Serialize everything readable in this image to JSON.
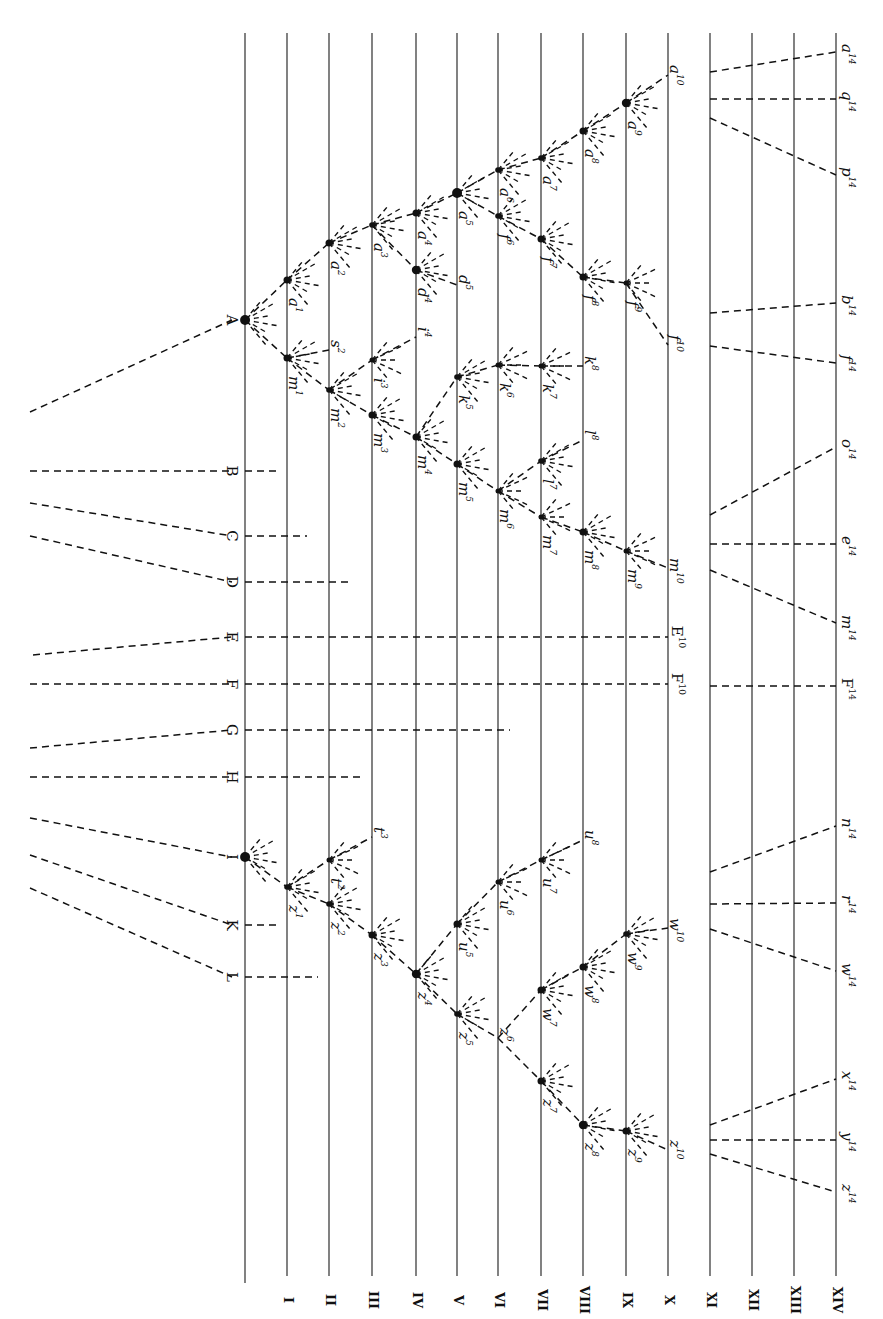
{
  "colors": {
    "ink": "#111111",
    "paper": "#ffffff"
  },
  "generations": [
    {
      "id": "base",
      "label": "",
      "x": 245
    },
    {
      "id": "I",
      "label": "I",
      "x": 287
    },
    {
      "id": "II",
      "label": "II",
      "x": 329
    },
    {
      "id": "III",
      "label": "III",
      "x": 372
    },
    {
      "id": "IV",
      "label": "IV",
      "x": 416
    },
    {
      "id": "V",
      "label": "V",
      "x": 457
    },
    {
      "id": "VI",
      "label": "VI",
      "x": 498
    },
    {
      "id": "VII",
      "label": "VII",
      "x": 541
    },
    {
      "id": "VIII",
      "label": "VIII",
      "x": 583
    },
    {
      "id": "IX",
      "label": "IX",
      "x": 626
    },
    {
      "id": "X",
      "label": "X",
      "x": 668
    },
    {
      "id": "XI",
      "label": "XI",
      "x": 710
    },
    {
      "id": "XII",
      "label": "XII",
      "x": 752
    },
    {
      "id": "XIII",
      "label": "XIII",
      "x": 794
    },
    {
      "id": "XIV",
      "label": "XIV",
      "x": 836
    }
  ],
  "ancestral_species": [
    {
      "label": "A",
      "y": 320,
      "tail": [
        30,
        412
      ]
    },
    {
      "label": "B",
      "y": 471,
      "tail": [
        30,
        471
      ],
      "stub_to": 277
    },
    {
      "label": "C",
      "y": 536,
      "tail": [
        30,
        503
      ],
      "stub_to": 307
    },
    {
      "label": "D",
      "y": 582,
      "tail": [
        30,
        536
      ],
      "stub_to": 353
    },
    {
      "label": "E",
      "y": 637,
      "tail": [
        33,
        655
      ],
      "stub_to": 668
    },
    {
      "label": "F",
      "y": 684,
      "tail": [
        30,
        684
      ],
      "stub_to": 668
    },
    {
      "label": "G",
      "y": 730,
      "tail": [
        30,
        748
      ],
      "stub_to": 510
    },
    {
      "label": "H",
      "y": 777,
      "tail": [
        30,
        777
      ],
      "stub_to": 360
    },
    {
      "label": "I",
      "y": 857,
      "tail": [
        30,
        818
      ]
    },
    {
      "label": "K",
      "y": 925,
      "tail": [
        30,
        855
      ],
      "stub_to": 280
    },
    {
      "label": "L",
      "y": 977,
      "tail": [
        30,
        888
      ],
      "stub_to": 318
    }
  ],
  "nodes": [
    {
      "id": "A",
      "x": 245,
      "y": 320,
      "size": 7
    },
    {
      "id": "a1",
      "name": "a",
      "gen": "1",
      "x": 287,
      "y": 280,
      "size": 5
    },
    {
      "id": "a2",
      "name": "a",
      "gen": "2",
      "x": 329,
      "y": 243,
      "size": 5
    },
    {
      "id": "a3",
      "name": "a",
      "gen": "3",
      "x": 372,
      "y": 225,
      "size": 4
    },
    {
      "id": "a4",
      "name": "a",
      "gen": "4",
      "x": 416,
      "y": 213,
      "size": 5
    },
    {
      "id": "a5",
      "name": "a",
      "gen": "5",
      "x": 457,
      "y": 193,
      "size": 7
    },
    {
      "id": "a6",
      "name": "a",
      "gen": "6",
      "x": 498,
      "y": 170,
      "size": 4
    },
    {
      "id": "a7",
      "name": "a",
      "gen": "7",
      "x": 541,
      "y": 158,
      "size": 4
    },
    {
      "id": "a8",
      "name": "a",
      "gen": "8",
      "x": 583,
      "y": 131,
      "size": 5
    },
    {
      "id": "a9",
      "name": "a",
      "gen": "9",
      "x": 626,
      "y": 103,
      "size": 6
    },
    {
      "id": "a10",
      "name": "a",
      "gen": "10",
      "x": 668,
      "y": 75,
      "size": 0
    },
    {
      "id": "d4",
      "name": "d",
      "gen": "4",
      "x": 416,
      "y": 270,
      "size": 6
    },
    {
      "id": "d5",
      "name": "d",
      "gen": "5",
      "x": 457,
      "y": 285,
      "size": 0
    },
    {
      "id": "f6",
      "name": "f",
      "gen": "6",
      "x": 498,
      "y": 216,
      "size": 4
    },
    {
      "id": "f7",
      "name": "f",
      "gen": "7",
      "x": 541,
      "y": 239,
      "size": 5
    },
    {
      "id": "f8",
      "name": "f",
      "gen": "8",
      "x": 583,
      "y": 277,
      "size": 5
    },
    {
      "id": "f9",
      "name": "f",
      "gen": "9",
      "x": 626,
      "y": 283,
      "size": 3
    },
    {
      "id": "f10",
      "name": "f",
      "gen": "10",
      "x": 668,
      "y": 345,
      "size": 0
    },
    {
      "id": "m1",
      "name": "m",
      "gen": "1",
      "x": 287,
      "y": 358,
      "size": 5
    },
    {
      "id": "s2",
      "name": "s",
      "gen": "2",
      "x": 329,
      "y": 350,
      "size": 0
    },
    {
      "id": "m2",
      "name": "m",
      "gen": "2",
      "x": 329,
      "y": 390,
      "size": 4
    },
    {
      "id": "i3",
      "name": "i",
      "gen": "3",
      "x": 372,
      "y": 360,
      "size": 3
    },
    {
      "id": "i4",
      "name": "i",
      "gen": "4",
      "x": 416,
      "y": 337,
      "size": 0
    },
    {
      "id": "m3",
      "name": "m",
      "gen": "3",
      "x": 372,
      "y": 415,
      "size": 5
    },
    {
      "id": "m4",
      "name": "m",
      "gen": "4",
      "x": 416,
      "y": 437,
      "size": 5
    },
    {
      "id": "k5",
      "name": "k",
      "gen": "5",
      "x": 457,
      "y": 377,
      "size": 4
    },
    {
      "id": "k6",
      "name": "k",
      "gen": "6",
      "x": 498,
      "y": 365,
      "size": 3
    },
    {
      "id": "k7",
      "name": "k",
      "gen": "7",
      "x": 541,
      "y": 366,
      "size": 3
    },
    {
      "id": "k8",
      "name": "k",
      "gen": "8",
      "x": 583,
      "y": 366,
      "size": 0
    },
    {
      "id": "m5",
      "name": "m",
      "gen": "5",
      "x": 457,
      "y": 464,
      "size": 5
    },
    {
      "id": "l7",
      "name": "l",
      "gen": "7",
      "x": 541,
      "y": 461,
      "size": 4
    },
    {
      "id": "l8",
      "name": "l",
      "gen": "8",
      "x": 583,
      "y": 440,
      "size": 0
    },
    {
      "id": "m6",
      "name": "m",
      "gen": "6",
      "x": 498,
      "y": 491,
      "size": 3
    },
    {
      "id": "m7",
      "name": "m",
      "gen": "7",
      "x": 541,
      "y": 517,
      "size": 3
    },
    {
      "id": "m8",
      "name": "m",
      "gen": "8",
      "x": 583,
      "y": 532,
      "size": 5
    },
    {
      "id": "m9",
      "name": "m",
      "gen": "9",
      "x": 626,
      "y": 551,
      "size": 3
    },
    {
      "id": "m10",
      "name": "m",
      "gen": "10",
      "x": 668,
      "y": 568,
      "size": 0
    },
    {
      "id": "I",
      "x": 245,
      "y": 857,
      "size": 7
    },
    {
      "id": "z1",
      "name": "z",
      "gen": "1",
      "x": 287,
      "y": 887,
      "size": 4
    },
    {
      "id": "t2",
      "name": "t",
      "gen": "2",
      "x": 329,
      "y": 860,
      "size": 3
    },
    {
      "id": "t3",
      "name": "t",
      "gen": "3",
      "x": 372,
      "y": 837,
      "size": 0
    },
    {
      "id": "z2",
      "name": "z",
      "gen": "2",
      "x": 329,
      "y": 904,
      "size": 4
    },
    {
      "id": "z3",
      "name": "z",
      "gen": "3",
      "x": 372,
      "y": 935,
      "size": 5
    },
    {
      "id": "z4",
      "name": "z",
      "gen": "4",
      "x": 416,
      "y": 974,
      "size": 6
    },
    {
      "id": "u5",
      "name": "u",
      "gen": "5",
      "x": 457,
      "y": 924,
      "size": 5
    },
    {
      "id": "u6",
      "name": "u",
      "gen": "6",
      "x": 498,
      "y": 882,
      "size": 3
    },
    {
      "id": "u7",
      "name": "u",
      "gen": "7",
      "x": 541,
      "y": 860,
      "size": 3
    },
    {
      "id": "u8",
      "name": "u",
      "gen": "8",
      "x": 583,
      "y": 840,
      "size": 0
    },
    {
      "id": "z5",
      "name": "z",
      "gen": "5",
      "x": 457,
      "y": 1014,
      "size": 4
    },
    {
      "id": "z6",
      "name": "z",
      "gen": "6",
      "x": 498,
      "y": 1038,
      "size": 0
    },
    {
      "id": "w7",
      "name": "w",
      "gen": "7",
      "x": 541,
      "y": 990,
      "size": 5
    },
    {
      "id": "w8",
      "name": "w",
      "gen": "8",
      "x": 583,
      "y": 967,
      "size": 5
    },
    {
      "id": "w9",
      "name": "w",
      "gen": "9",
      "x": 626,
      "y": 934,
      "size": 4
    },
    {
      "id": "w10",
      "name": "w",
      "gen": "10",
      "x": 668,
      "y": 928,
      "size": 0
    },
    {
      "id": "z7",
      "name": "z",
      "gen": "7",
      "x": 541,
      "y": 1081,
      "size": 5
    },
    {
      "id": "z8",
      "name": "z",
      "gen": "8",
      "x": 583,
      "y": 1125,
      "size": 6
    },
    {
      "id": "z9",
      "name": "z",
      "gen": "9",
      "x": 626,
      "y": 1131,
      "size": 5
    },
    {
      "id": "z10",
      "name": "z",
      "gen": "10",
      "x": 668,
      "y": 1150,
      "size": 0
    }
  ],
  "edges": [
    [
      "A",
      "a1"
    ],
    [
      "a1",
      "a2"
    ],
    [
      "a2",
      "a3"
    ],
    [
      "a3",
      "a4"
    ],
    [
      "a4",
      "a5"
    ],
    [
      "a5",
      "a6"
    ],
    [
      "a6",
      "a7"
    ],
    [
      "a7",
      "a8"
    ],
    [
      "a8",
      "a9"
    ],
    [
      "a9",
      "a10"
    ],
    [
      "a3",
      "d4"
    ],
    [
      "d4",
      "d5"
    ],
    [
      "a5",
      "f6"
    ],
    [
      "f6",
      "f7"
    ],
    [
      "f7",
      "f8"
    ],
    [
      "f8",
      "f9"
    ],
    [
      "f9",
      "f10"
    ],
    [
      "A",
      "m1"
    ],
    [
      "m1",
      "s2"
    ],
    [
      "m1",
      "m2"
    ],
    [
      "m2",
      "i3"
    ],
    [
      "i3",
      "i4"
    ],
    [
      "m2",
      "m3"
    ],
    [
      "m3",
      "m4"
    ],
    [
      "m4",
      "k5"
    ],
    [
      "k5",
      "k6"
    ],
    [
      "k6",
      "k7"
    ],
    [
      "k7",
      "k8"
    ],
    [
      "m4",
      "m5"
    ],
    [
      "m5",
      "m6"
    ],
    [
      "m6",
      "l7"
    ],
    [
      "l7",
      "l8"
    ],
    [
      "m6",
      "m7"
    ],
    [
      "m7",
      "m8"
    ],
    [
      "m8",
      "m9"
    ],
    [
      "m9",
      "m10"
    ],
    [
      "I",
      "z1"
    ],
    [
      "z1",
      "t2"
    ],
    [
      "t2",
      "t3"
    ],
    [
      "z1",
      "z2"
    ],
    [
      "z2",
      "z3"
    ],
    [
      "z3",
      "z4"
    ],
    [
      "z4",
      "u5"
    ],
    [
      "u5",
      "u6"
    ],
    [
      "u6",
      "u7"
    ],
    [
      "u7",
      "u8"
    ],
    [
      "z4",
      "z5"
    ],
    [
      "z5",
      "z6"
    ],
    [
      "z6",
      "w7"
    ],
    [
      "w7",
      "w8"
    ],
    [
      "w8",
      "w9"
    ],
    [
      "w9",
      "w10"
    ],
    [
      "z6",
      "z7"
    ],
    [
      "z7",
      "z8"
    ],
    [
      "z8",
      "z9"
    ],
    [
      "z9",
      "z10"
    ]
  ],
  "labels_gen10": [
    {
      "text": "a",
      "sup": "10",
      "x": 672,
      "y": 60
    },
    {
      "text": "f",
      "sup": "10",
      "x": 672,
      "y": 360
    },
    {
      "text": "m",
      "sup": "10",
      "x": 672,
      "y": 583
    },
    {
      "text": "E",
      "sup": "10",
      "x": 672,
      "y": 637,
      "upright": true
    },
    {
      "text": "F",
      "sup": "10",
      "x": 672,
      "y": 684,
      "upright": true
    },
    {
      "text": "w",
      "sup": "10",
      "x": 672,
      "y": 943
    },
    {
      "text": "z",
      "sup": "10",
      "x": 672,
      "y": 1165
    }
  ],
  "gen14_species": [
    {
      "text": "a",
      "sup": "14",
      "y": 52,
      "from_y": 72
    },
    {
      "text": "q",
      "sup": "14",
      "y": 99,
      "from_y": 99
    },
    {
      "text": "p",
      "sup": "14",
      "y": 175,
      "from_y": 118
    },
    {
      "text": "b",
      "sup": "14",
      "y": 303,
      "from_y": 313
    },
    {
      "text": "f",
      "sup": "14",
      "y": 363,
      "from_y": 346
    },
    {
      "text": "o",
      "sup": "14",
      "y": 447,
      "from_y": 515
    },
    {
      "text": "e",
      "sup": "14",
      "y": 544,
      "from_y": 544
    },
    {
      "text": "m",
      "sup": "14",
      "y": 623,
      "from_y": 570
    },
    {
      "text": "F",
      "sup": "14",
      "y": 686,
      "from_y": 686,
      "upright": true
    },
    {
      "text": "n",
      "sup": "14",
      "y": 826,
      "from_y": 872
    },
    {
      "text": "r",
      "sup": "14",
      "y": 903,
      "from_y": 904
    },
    {
      "text": "w",
      "sup": "14",
      "y": 971,
      "from_y": 929
    },
    {
      "text": "x",
      "sup": "14",
      "y": 1079,
      "from_y": 1125
    },
    {
      "text": "y",
      "sup": "14",
      "y": 1140,
      "from_y": 1140
    },
    {
      "text": "z",
      "sup": "14",
      "y": 1192,
      "from_y": 1154
    }
  ],
  "gap": {
    "from_x": 668,
    "to_x": 710,
    "note": "break between generation X and XI"
  }
}
